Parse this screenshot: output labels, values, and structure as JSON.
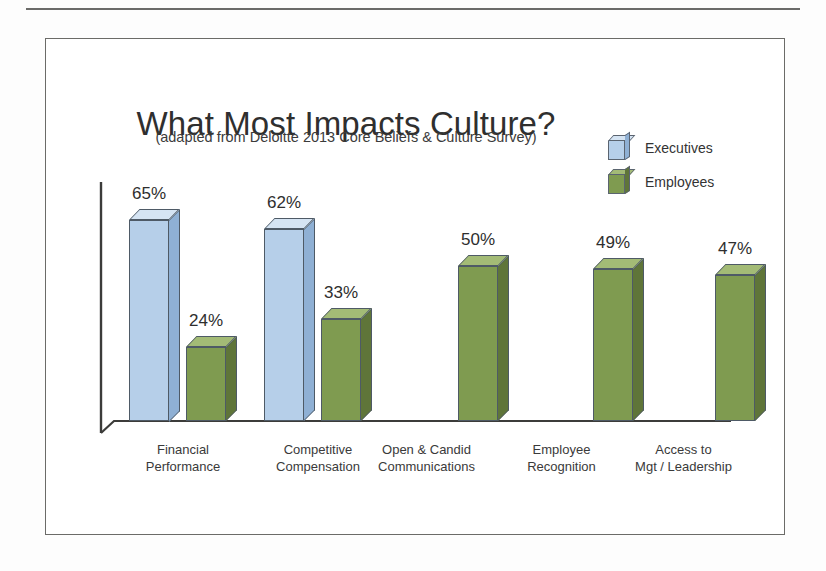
{
  "page": {
    "background_color": "#fdfdfd",
    "rule_color": "#4a4a48",
    "slide_border_color": "#6b6b68"
  },
  "chart_data": {
    "type": "bar",
    "title": "What Most Impacts Culture?",
    "subtitle": "(adapted from Deloitte 2013 Core Beliefs & Culture Survey)",
    "xlabel": "",
    "ylabel": "",
    "ylim": [
      0,
      72
    ],
    "grid": false,
    "legend_position": "top-right",
    "value_suffix": "%",
    "categories": [
      "Financial Performance",
      "Competitive Compensation",
      "Open & Candid Communications",
      "Employee Recognition",
      "Access to Mgt / Leadership"
    ],
    "category_lines": [
      [
        "Financial",
        "Performance"
      ],
      [
        "Competitive",
        "Compensation"
      ],
      [
        "Open & Candid",
        "Communications"
      ],
      [
        "Employee",
        "Recognition"
      ],
      [
        "Access to",
        "Mgt / Leadership"
      ]
    ],
    "series": [
      {
        "name": "Executives",
        "color": "#b6cfe9",
        "top_color": "#d5e4f3",
        "side_color": "#8fb0d4",
        "values": [
          65,
          62,
          null,
          null,
          null
        ],
        "labels": [
          "65%",
          "62%",
          "",
          "",
          ""
        ]
      },
      {
        "name": "Employees",
        "color": "#7f9b50",
        "top_color": "#a3bb76",
        "side_color": "#5f7539",
        "values": [
          24,
          33,
          50,
          49,
          47
        ],
        "labels": [
          "24%",
          "33%",
          "50%",
          "49%",
          "47%"
        ]
      }
    ]
  },
  "legend": {
    "items": [
      {
        "label": "Executives",
        "icon": "cube-icon-blue"
      },
      {
        "label": "Employees",
        "icon": "cube-icon-green"
      }
    ]
  },
  "axis": {
    "baseline_color": "#3c3c3a",
    "y_axis_color": "#3c3c3a",
    "tick_labels": []
  }
}
